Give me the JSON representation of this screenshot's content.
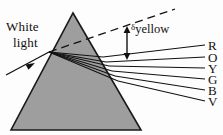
{
  "figure": {
    "type": "optics-ray-diagram",
    "background_color": "#fdfdfd",
    "ink_color": "#111111",
    "prism_fill_color": "#9e9e9e",
    "prism_stroke_color": "#1a1a1a"
  },
  "labels": {
    "white_light_line1": "White",
    "white_light_line2": "light",
    "delta_symbol": "δ",
    "delta_subscript": "yellow"
  },
  "prism": {
    "name": "triangular-glass-prism",
    "apex": {
      "x": 73,
      "y": 13
    },
    "base_left": {
      "x": 11,
      "y": 130
    },
    "base_right": {
      "x": 141,
      "y": 130
    }
  },
  "incident_ray": {
    "label": "white-light-incident-ray",
    "from": {
      "x": 6,
      "y": 75
    },
    "to": {
      "x": 49,
      "y": 52
    },
    "arrow_at": {
      "x": 31,
      "y": 65
    }
  },
  "entry_point": {
    "x": 49,
    "y": 52
  },
  "dashed_extension": {
    "label": "undeviated-direction",
    "from": {
      "x": 49,
      "y": 52
    },
    "to": {
      "x": 175,
      "y": 9
    }
  },
  "deviation_arrow": {
    "label": "deviation-angle-marker",
    "x": 127,
    "y_top": 28,
    "y_bottom": 58
  },
  "spectrum": {
    "label": "dispersed-spectrum",
    "rays": [
      {
        "letter": "R",
        "color_name": "red",
        "exit": {
          "x": 103,
          "y": 57
        },
        "end": {
          "x": 205,
          "y": 45
        },
        "label_y": 39
      },
      {
        "letter": "O",
        "color_name": "orange",
        "exit": {
          "x": 106,
          "y": 62
        },
        "end": {
          "x": 205,
          "y": 57
        },
        "label_y": 51
      },
      {
        "letter": "Y",
        "color_name": "yellow",
        "exit": {
          "x": 109,
          "y": 66
        },
        "end": {
          "x": 205,
          "y": 68
        },
        "label_y": 62
      },
      {
        "letter": "G",
        "color_name": "green",
        "exit": {
          "x": 112,
          "y": 71
        },
        "end": {
          "x": 205,
          "y": 79
        },
        "label_y": 73
      },
      {
        "letter": "B",
        "color_name": "blue",
        "exit": {
          "x": 115,
          "y": 76
        },
        "end": {
          "x": 205,
          "y": 90
        },
        "label_y": 84
      },
      {
        "letter": "V",
        "color_name": "violet",
        "exit": {
          "x": 118,
          "y": 81
        },
        "end": {
          "x": 205,
          "y": 101
        },
        "label_y": 95
      }
    ]
  },
  "internal_rays": {
    "label": "refracted-rays-inside-prism",
    "from": {
      "x": 49,
      "y": 52
    },
    "count": 6
  }
}
